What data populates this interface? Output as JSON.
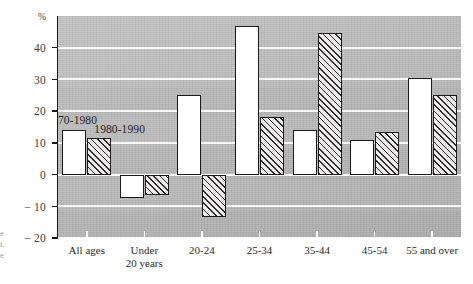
{
  "chart_data": {
    "type": "bar",
    "title": "",
    "xlabel": "",
    "ylabel": "%",
    "ylim": [
      -20,
      50
    ],
    "yticks": [
      40,
      30,
      20,
      10,
      0,
      -10,
      -20
    ],
    "ytick_labels": [
      "40",
      "30",
      "20",
      "10",
      "0",
      "− 10",
      "− 20"
    ],
    "grid": "horizontal white gridlines",
    "legend_position": "inside plot, upper-left above first group",
    "categories": [
      "All ages",
      "Under 20 years",
      "20-24",
      "25-34",
      "35-44",
      "45-54",
      "55 and over"
    ],
    "category_lines": [
      [
        "All ages"
      ],
      [
        "Under",
        "20 years"
      ],
      [
        "20-24"
      ],
      [
        "25-34"
      ],
      [
        "35-44"
      ],
      [
        "45-54"
      ],
      [
        "55 and over"
      ]
    ],
    "series": [
      {
        "name": "1970-1980",
        "style": "white",
        "values": [
          14,
          -7.5,
          25,
          47,
          14,
          11,
          30.5
        ]
      },
      {
        "name": "1980-1990",
        "style": "hatched",
        "values": [
          11.5,
          -6.5,
          -13.5,
          18,
          44.5,
          13.5,
          25
        ]
      }
    ]
  },
  "axis": {
    "unit_label": "%"
  },
  "legend": {
    "items": [
      {
        "label": "1970-1980"
      },
      {
        "label": "1980-1990"
      }
    ]
  },
  "edge_caption": {
    "lines": [
      "e",
      "t.",
      "e"
    ]
  },
  "colors": {
    "plot_background": "#b9b9b9",
    "gridline": "#fbfbfb",
    "bar_outline": "#1a1a1a",
    "series1_fill": "#ffffff",
    "series2_hatch": "#2a2a2a",
    "text": "#2b2b2b"
  }
}
